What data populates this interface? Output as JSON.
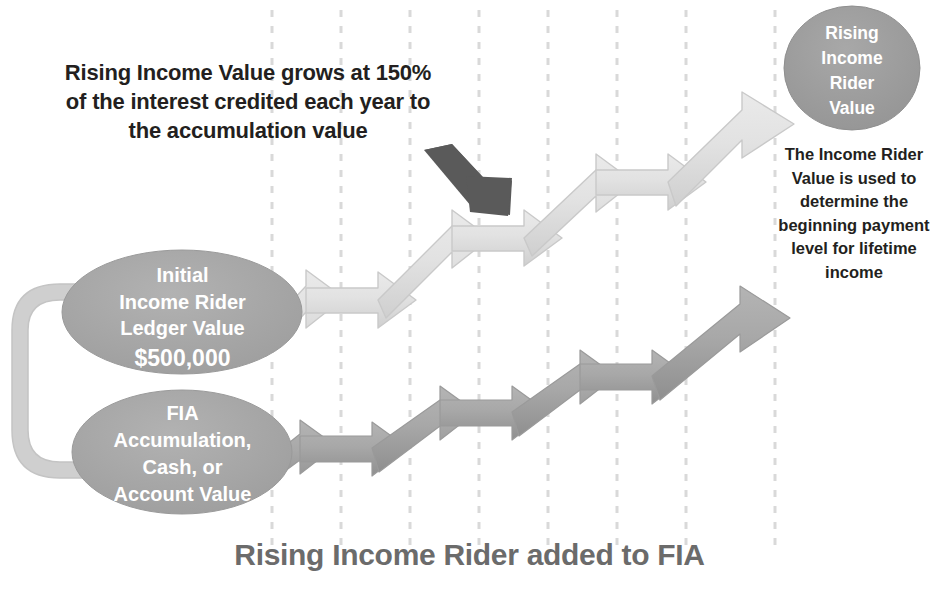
{
  "figure": {
    "title": "Rising Income Rider added to FIA",
    "callout": "Rising Income Value grows at 150% of the interest credited each year to the accumulation value",
    "circle": {
      "label": "Rising Income Rider Value",
      "line1": "Rising",
      "line2": "Income",
      "line3": "Rider",
      "line4": "Value",
      "fill": "#9e9e9e"
    },
    "note_right": "The Income Rider Value is used to determine the beginning payment level for lifetime income",
    "ellipse_upper": {
      "line1": "Initial",
      "line2": "Income Rider",
      "line3": "Ledger Value",
      "amount": "$500,000",
      "fill": "#a6a6a6"
    },
    "ellipse_lower": {
      "line1": "FIA",
      "line2": "Accumulation,",
      "line3": "Cash, or",
      "line4": "Account Value",
      "fill": "#a6a6a6"
    },
    "arrow_upper_name": "rising-income-value-staircase",
    "arrow_lower_name": "accumulation-value-staircase",
    "pointer_name": "callout-pointer-arrow",
    "connector_name": "ledger-to-accumulation-connector",
    "colors": {
      "staircase_upper_fill": "#dcdcdc",
      "staircase_upper_stroke": "#c2c2c2",
      "staircase_lower_fill": "#a3a3a3",
      "pointer": "#5a5a5a",
      "connector": "#cfcfcf",
      "gridline": "#d9d9d9",
      "title": "#6b6b6b",
      "text": "#231f20"
    },
    "gridlines": [
      272,
      341,
      410,
      479,
      548,
      617,
      686,
      775
    ],
    "gridline_top": 10,
    "gridline_bottom": 546
  }
}
